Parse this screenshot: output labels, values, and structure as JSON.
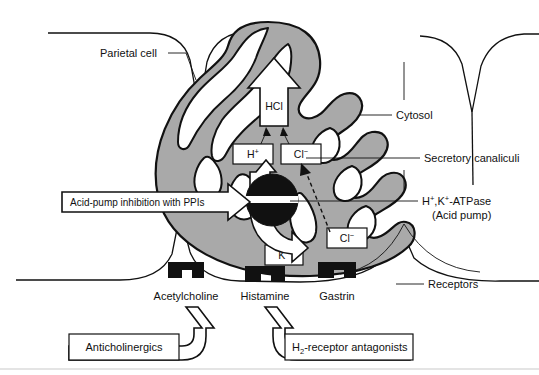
{
  "figure": {
    "colors": {
      "cell_fill": "#a9a9a9",
      "outline": "#111111",
      "background": "#ffffff",
      "rule": "#c9c9c9"
    }
  },
  "labels": {
    "parietal_cell": "Parietal cell",
    "cytosol": "Cytosol",
    "secretory_canaliculi": "Secretory canaliculi",
    "atpase_line1": "H",
    "atpase_line1_sup1": "+",
    "atpase_line1_mid": ",K",
    "atpase_line1_sup2": "+",
    "atpase_line1_end": "-ATPase",
    "atpase_full": "H+,K+-ATPase",
    "atpase_line2": "(Acid pump)",
    "receptors": "Receptors"
  },
  "ions": {
    "hcl": "HCl",
    "h_base": "H",
    "h_sup": "+",
    "cl_base": "Cl",
    "cl_sup": "−",
    "k_base": "K",
    "k_sup": "+",
    "h_full": "H+",
    "cl_full": "Cl−",
    "k_full": "K+"
  },
  "receptor_agonists": [
    {
      "name": "acetylcholine-receptor",
      "label": "Acetylcholine"
    },
    {
      "name": "histamine-receptor",
      "label": "Histamine"
    },
    {
      "name": "gastrin-receptor",
      "label": "Gastrin"
    }
  ],
  "drug_boxes": {
    "ppi": "Acid-pump inhibition with PPIs",
    "anticholinergics": "Anticholinergics",
    "h2_base": "H",
    "h2_sub": "2",
    "h2_rest": "-receptor antagonists",
    "h2_full": "H2-receptor antagonists"
  }
}
